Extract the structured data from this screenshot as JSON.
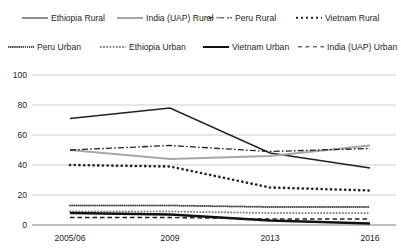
{
  "chart_data": {
    "type": "line",
    "title": "",
    "xlabel": "",
    "ylabel": "",
    "categories": [
      "2005/06",
      "2009",
      "2013",
      "2016"
    ],
    "ylim": [
      0,
      100
    ],
    "yticks": [
      0,
      20,
      40,
      60,
      80,
      100
    ],
    "grid": true,
    "legend_position": "top",
    "series": [
      {
        "name": "Ethiopia Rural",
        "style": "solid-thin",
        "color": "#231f20",
        "values": [
          71,
          78,
          48,
          38
        ]
      },
      {
        "name": "India (UAP) Rural",
        "style": "solid-gray",
        "color": "#a6a6a6",
        "values": [
          50,
          44,
          46,
          53
        ]
      },
      {
        "name": "Peru Rural",
        "style": "dashdot",
        "color": "#231f20",
        "values": [
          50,
          53,
          49,
          51
        ]
      },
      {
        "name": "Vietnam Rural",
        "style": "dotbig",
        "color": "#231f20",
        "values": [
          40,
          39,
          25,
          23
        ]
      },
      {
        "name": "Peru Urban",
        "style": "dotfine",
        "color": "#4d4d4d",
        "values": [
          13,
          13,
          12,
          12
        ]
      },
      {
        "name": "Ethiopia Urban",
        "style": "dotmed",
        "color": "#808080",
        "values": [
          9,
          9,
          8,
          8
        ]
      },
      {
        "name": "Vietnam Urban",
        "style": "solid-thick",
        "color": "#111111",
        "values": [
          8,
          7,
          3,
          1
        ]
      },
      {
        "name": "India (UAP) Urban",
        "style": "dash",
        "color": "#231f20",
        "values": [
          5,
          5,
          4,
          4
        ]
      }
    ]
  },
  "legend": {
    "items": [
      {
        "label": "Ethiopia Rural",
        "style": "solid-thin"
      },
      {
        "label": "India (UAP) Rural",
        "style": "solid-gray"
      },
      {
        "label": "Peru Rural",
        "style": "dashdot"
      },
      {
        "label": "Vietnam Rural",
        "style": "dotbig"
      },
      {
        "label": "Peru Urban",
        "style": "dotfine"
      },
      {
        "label": "Ethiopia Urban",
        "style": "dotmed"
      },
      {
        "label": "Vietnam Urban",
        "style": "solid-thick"
      },
      {
        "label": "India (UAP) Urban",
        "style": "dash"
      }
    ]
  },
  "axis": {
    "y_tick_labels": [
      "100",
      "80",
      "60",
      "40",
      "20",
      "0"
    ],
    "x_tick_labels": [
      "2005/06",
      "2009",
      "2013",
      "2016"
    ]
  },
  "colors": {
    "text": "#231f20",
    "gridline": "#bfbfbf",
    "axisline": "#808080"
  }
}
